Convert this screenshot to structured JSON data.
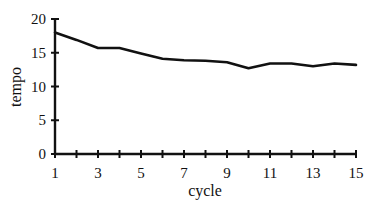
{
  "chart_data": {
    "type": "line",
    "title": "",
    "xlabel": "cycle",
    "ylabel": "tempo",
    "x": [
      1,
      2,
      3,
      4,
      5,
      6,
      7,
      8,
      9,
      10,
      11,
      12,
      13,
      14,
      15
    ],
    "series": [
      {
        "name": "tempo",
        "values": [
          18.0,
          16.9,
          15.7,
          15.7,
          14.9,
          14.1,
          13.9,
          13.8,
          13.6,
          12.7,
          13.4,
          13.4,
          13.0,
          13.4,
          13.2
        ]
      }
    ],
    "xlim": [
      1,
      15
    ],
    "ylim": [
      0,
      20
    ],
    "x_tick_labels": [
      "1",
      "3",
      "5",
      "7",
      "9",
      "11",
      "13",
      "15"
    ],
    "x_ticks": [
      1,
      2,
      3,
      4,
      5,
      6,
      7,
      8,
      9,
      10,
      11,
      12,
      13,
      14,
      15
    ],
    "y_tick_labels": [
      "0",
      "5",
      "10",
      "15",
      "20"
    ],
    "grid": false,
    "legend": "none"
  }
}
